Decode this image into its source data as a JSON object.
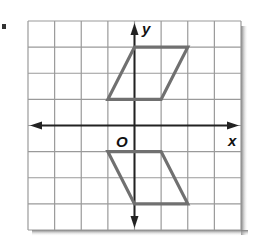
{
  "problem": {
    "marker": "."
  },
  "graph": {
    "x_axis_label": "x",
    "y_axis_label": "y",
    "origin_label": "O",
    "grid": {
      "xmin": -4,
      "xmax": 4,
      "ymin": -4,
      "ymax": 4,
      "step": 1
    },
    "colors": {
      "grid": "#9a9a9a",
      "axes": "#222222",
      "shape": "#707070",
      "shadow": "#8a8a8a"
    },
    "shapes": [
      {
        "name": "parallelogram-original",
        "vertices": [
          [
            0,
            3
          ],
          [
            2,
            3
          ],
          [
            1,
            1
          ],
          [
            -1,
            1
          ]
        ]
      },
      {
        "name": "parallelogram-reflected",
        "vertices": [
          [
            -1,
            -1
          ],
          [
            1,
            -1
          ],
          [
            2,
            -3
          ],
          [
            0,
            -3
          ]
        ]
      }
    ]
  }
}
